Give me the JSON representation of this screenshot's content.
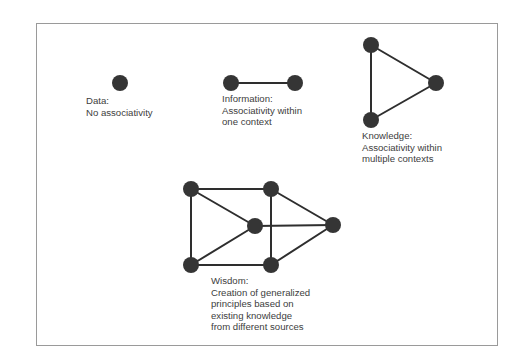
{
  "diagram": {
    "type": "knowledge-hierarchy-graphs",
    "frame": {
      "border_color": "#9a9a9a",
      "background": "#ffffff"
    },
    "colors": {
      "node": "#353535",
      "edge": "#2e2e2e",
      "text": "#404040"
    },
    "panels": [
      {
        "id": "data",
        "title": "Data:",
        "description_lines": [
          "No associativity"
        ],
        "nodes": [
          {
            "id": "d1",
            "x": 120,
            "y": 83
          }
        ],
        "edges": []
      },
      {
        "id": "information",
        "title": "Information:",
        "description_lines": [
          "Associativity within",
          "one context"
        ],
        "nodes": [
          {
            "id": "i1",
            "x": 231,
            "y": 83
          },
          {
            "id": "i2",
            "x": 295,
            "y": 83
          }
        ],
        "edges": [
          [
            "i1",
            "i2"
          ]
        ]
      },
      {
        "id": "knowledge",
        "title": "Knowledge:",
        "description_lines": [
          "Associativity within",
          "multiple contexts"
        ],
        "nodes": [
          {
            "id": "k1",
            "x": 371,
            "y": 45
          },
          {
            "id": "k2",
            "x": 436,
            "y": 83
          },
          {
            "id": "k3",
            "x": 371,
            "y": 120
          }
        ],
        "edges": [
          [
            "k1",
            "k2"
          ],
          [
            "k2",
            "k3"
          ],
          [
            "k1",
            "k3"
          ]
        ]
      },
      {
        "id": "wisdom",
        "title": "Wisdom:",
        "description_lines": [
          "Creation of generalized",
          "principles based on",
          "existing knowledge",
          "from different sources"
        ],
        "nodes": [
          {
            "id": "w_tl",
            "x": 191,
            "y": 189
          },
          {
            "id": "w_tr",
            "x": 271,
            "y": 189
          },
          {
            "id": "w_c",
            "x": 255,
            "y": 226
          },
          {
            "id": "w_r",
            "x": 333,
            "y": 225
          },
          {
            "id": "w_bl",
            "x": 191,
            "y": 265
          },
          {
            "id": "w_br",
            "x": 271,
            "y": 265
          }
        ],
        "edges": [
          [
            "w_tl",
            "w_tr"
          ],
          [
            "w_tl",
            "w_bl"
          ],
          [
            "w_tl",
            "w_c"
          ],
          [
            "w_bl",
            "w_c"
          ],
          [
            "w_bl",
            "w_br"
          ],
          [
            "w_tr",
            "w_br"
          ],
          [
            "w_tr",
            "w_r"
          ],
          [
            "w_c",
            "w_r"
          ],
          [
            "w_br",
            "w_r"
          ]
        ]
      }
    ]
  }
}
